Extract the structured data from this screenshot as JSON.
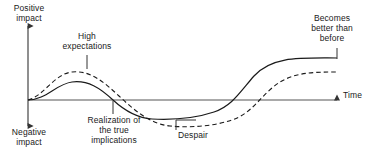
{
  "diagram": {
    "axes": {
      "y_top_label": "Positive\nimpact",
      "y_bottom_label": "Negative\nimpact",
      "x_label": "Time",
      "origin": {
        "x": 28,
        "y": 100
      },
      "y_axis_top": 22,
      "y_axis_bottom": 130,
      "x_axis_end": 341
    },
    "annotations": [
      {
        "name": "high-expectations",
        "text": "High\nexpectations"
      },
      {
        "name": "realization",
        "text": "Realization of\nthe true\nimplications"
      },
      {
        "name": "despair",
        "text": "Despair"
      },
      {
        "name": "becomes-better",
        "text": "Becomes\nbetter than\nbefore"
      }
    ],
    "colors": {
      "stroke": "#1a1a1a",
      "axis": "#555555",
      "background": "#ffffff"
    },
    "series": [
      {
        "name": "actual-performance",
        "style": "solid",
        "path": "M28,100 C46,100 56,84 72,82 C88,80 100,88 113,100 C126,112 138,118 152,119 C172,120 196,118 214,112 C232,106 240,92 254,76 C272,56 300,58 337,58"
      },
      {
        "name": "expectations",
        "style": "dashed",
        "dasharray": "4.5,3",
        "path": "M28,100 C44,96 54,74 72,72 C90,70 104,82 119,96 C134,110 150,124 170,126 C192,128 214,126 232,120 C250,114 258,100 272,88 C290,72 312,72 337,72"
      }
    ],
    "leaders": [
      {
        "name": "high-expectations-leader",
        "path": "M87,55 L87,69"
      },
      {
        "name": "realization-leader",
        "path": "M113,101 L113,114"
      },
      {
        "name": "despair-leader",
        "path": "M176,129 L176,120 L196,120"
      },
      {
        "name": "becomes-better-leader",
        "path": "M337,48 L337,59"
      }
    ]
  }
}
